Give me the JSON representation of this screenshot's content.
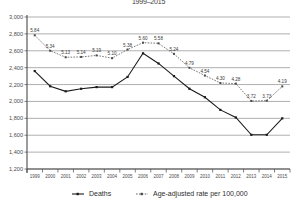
{
  "chart_data": {
    "type": "line",
    "title": "1999–2015",
    "xlabel": "",
    "ylabel": "",
    "ylim": [
      1200,
      3000
    ],
    "ytick_step": 200,
    "grid": true,
    "legend_position": "bottom",
    "categories": [
      "1999",
      "2000",
      "2001",
      "2002",
      "2003",
      "2004",
      "2005",
      "2006",
      "2007",
      "2008",
      "2009",
      "2010",
      "2011",
      "2012",
      "2013",
      "2014",
      "2015"
    ],
    "yticks": [
      "1,200",
      "1,400",
      "1,600",
      "1,800",
      "2,000",
      "2,200",
      "2,400",
      "2,600",
      "2,800",
      "3,000"
    ],
    "series": [
      {
        "name": "Deaths",
        "style": "solid",
        "values": [
          2360,
          2180,
          2120,
          2150,
          2170,
          2170,
          2290,
          2570,
          2450,
          2300,
          2150,
          2050,
          1900,
          1810,
          1605,
          1605,
          1800
        ]
      },
      {
        "name": "Age-adjusted rate per 100,000",
        "style": "dashed",
        "values": [
          5.84,
          5.34,
          5.13,
          5.14,
          5.19,
          5.1,
          5.38,
          5.6,
          5.58,
          5.24,
          4.79,
          4.54,
          4.3,
          4.28,
          3.72,
          3.73,
          4.19
        ],
        "labels": [
          "5.84",
          "5.34",
          "5.13",
          "5.14",
          "5.19",
          "5.10",
          "5.38",
          "5.60",
          "5.58",
          "5.24",
          "4.79",
          "4.54",
          "4.30",
          "4.28",
          "3.72",
          "3.73",
          "4.19"
        ]
      }
    ]
  },
  "legend": {
    "deaths_label": "Deaths",
    "rate_label": "Age-adjusted rate per 100,000"
  }
}
